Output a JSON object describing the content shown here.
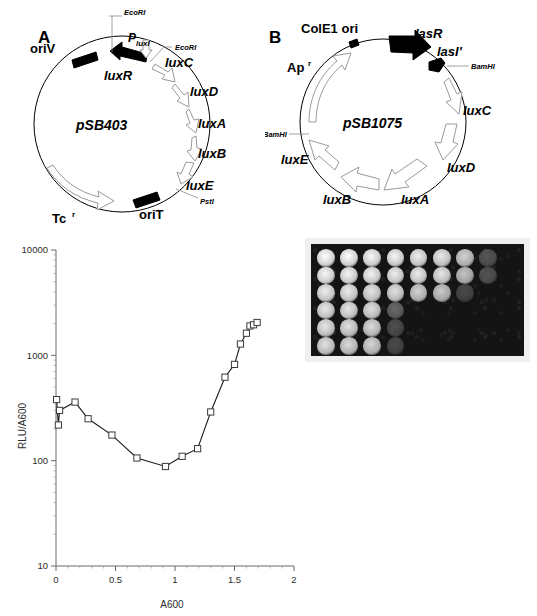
{
  "figure": {
    "panels": [
      {
        "letter": "A",
        "plasmid_name": "pSB403"
      },
      {
        "letter": "B",
        "plasmid_name": "pSB1075"
      }
    ]
  },
  "panel_a": {
    "letter": "A",
    "plasmid_name": "pSB403",
    "features": [
      {
        "label": "oriV",
        "type": "solid-arrow"
      },
      {
        "label": "luxR",
        "type": "solid-arrow"
      },
      {
        "label": "luxC",
        "type": "open-arrow"
      },
      {
        "label": "luxD",
        "type": "open-arrow"
      },
      {
        "label": "luxA",
        "type": "open-arrow"
      },
      {
        "label": "luxB",
        "type": "open-arrow"
      },
      {
        "label": "luxE",
        "type": "open-arrow"
      },
      {
        "label": "oriT",
        "type": "solid-arrow"
      },
      {
        "label": "Tc",
        "superscript": "r",
        "type": "open-arrow"
      }
    ],
    "promoter": {
      "label": "P",
      "subscript": "luxI"
    },
    "restriction_sites": [
      "EcoRI",
      "EcoRI",
      "PstI"
    ]
  },
  "panel_b": {
    "letter": "B",
    "plasmid_name": "pSB1075",
    "features": [
      {
        "label": "ColE1 ori",
        "type": "marker"
      },
      {
        "label": "lasR",
        "type": "solid-arrow"
      },
      {
        "label": "lasI'",
        "type": "solid-arrow"
      },
      {
        "label": "luxC",
        "type": "open-arrow"
      },
      {
        "label": "luxD",
        "type": "open-arrow"
      },
      {
        "label": "luxA",
        "type": "open-arrow"
      },
      {
        "label": "luxB",
        "type": "open-arrow"
      },
      {
        "label": "luxE",
        "type": "open-arrow"
      },
      {
        "label": "Ap",
        "superscript": "r",
        "type": "open-arrow"
      }
    ],
    "restriction_sites": [
      "BamHI",
      "BamHI"
    ]
  },
  "chart_data": {
    "type": "line",
    "title": "",
    "xlabel": "A600",
    "ylabel": "RLU/A600",
    "xlim": [
      0,
      2
    ],
    "ylim": [
      10,
      10000
    ],
    "yscale": "log",
    "xscale": "linear",
    "xticks": [
      0,
      0.5,
      1,
      1.5,
      2
    ],
    "xtick_labels": [
      "0",
      "0.5",
      "1",
      "1.5",
      "2"
    ],
    "yticks": [
      10,
      100,
      1000,
      10000
    ],
    "ytick_labels": [
      "10",
      "100",
      "1000",
      "10000"
    ],
    "grid": false,
    "legend": false,
    "marker": "open-square",
    "series": [
      {
        "name": "pSB1075 bioluminescence",
        "x": [
          0.005,
          0.02,
          0.03,
          0.16,
          0.27,
          0.47,
          0.68,
          0.92,
          1.06,
          1.19,
          1.3,
          1.42,
          1.5,
          1.55,
          1.6,
          1.63,
          1.66,
          1.69
        ],
        "y": [
          380,
          218,
          300,
          360,
          250,
          175,
          106,
          88,
          110,
          130,
          290,
          620,
          820,
          1280,
          1620,
          1900,
          1950,
          2050
        ]
      }
    ]
  },
  "plate": {
    "name": "bioluminescence-plate-image",
    "rows": 6,
    "columns": 8,
    "spot_grid": [
      [
        1.0,
        1.0,
        0.98,
        0.97,
        0.95,
        0.93,
        0.85,
        0.3,
        0.0
      ],
      [
        0.98,
        0.97,
        0.96,
        0.95,
        0.94,
        0.92,
        0.8,
        0.28,
        0.0
      ],
      [
        0.95,
        0.94,
        0.92,
        0.9,
        0.85,
        0.82,
        0.22,
        0.0,
        0.0
      ],
      [
        0.93,
        0.92,
        0.9,
        0.4,
        0.0,
        0.0,
        0.0,
        0.0,
        0.0
      ],
      [
        0.92,
        0.9,
        0.88,
        0.25,
        0.0,
        0.0,
        0.0,
        0.0,
        0.0
      ],
      [
        0.9,
        0.88,
        0.86,
        0.22,
        0.0,
        0.0,
        0.0,
        0.0,
        0.0
      ]
    ]
  },
  "colors": {
    "background": "#ffffff",
    "ink": "#000000",
    "axis": "#6b6b6b",
    "plate_background": "#141414",
    "plate_spot": "#f2f2f2"
  }
}
